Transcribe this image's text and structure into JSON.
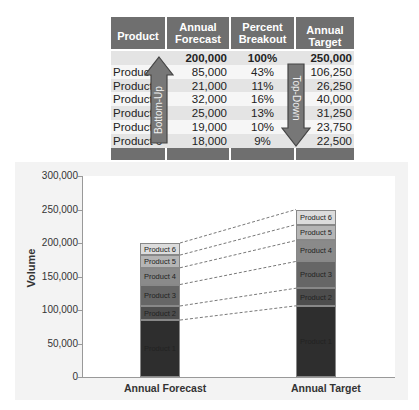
{
  "table": {
    "headers": [
      "Product",
      "Annual Forecast",
      "Percent Breakout",
      "Annual Target"
    ],
    "total_row": {
      "product": "",
      "forecast": "200,000",
      "percent": "100%",
      "target": "250,000"
    },
    "rows": [
      {
        "product": "Product 1",
        "forecast": "85,000",
        "percent": "43%",
        "target": "106,250"
      },
      {
        "product": "Product 2",
        "forecast": "21,000",
        "percent": "11%",
        "target": "26,250"
      },
      {
        "product": "Product 3",
        "forecast": "32,000",
        "percent": "16%",
        "target": "40,000"
      },
      {
        "product": "Product 4",
        "forecast": "25,000",
        "percent": "13%",
        "target": "31,250"
      },
      {
        "product": "Product 5",
        "forecast": "19,000",
        "percent": "10%",
        "target": "23,750"
      },
      {
        "product": "Product 6",
        "forecast": "18,000",
        "percent": "9%",
        "target": "22,500"
      }
    ],
    "arrow_up_label": "Bottom-Up",
    "arrow_down_label": "Top-Down"
  },
  "chart_data": {
    "type": "bar",
    "stacked": true,
    "title": "",
    "xlabel": "",
    "ylabel": "Volume",
    "ylim": [
      0,
      300000
    ],
    "yticks": [
      "0",
      "50,000",
      "100,000",
      "150,000",
      "200,000",
      "250,000",
      "300,000"
    ],
    "categories": [
      "Annual Forecast",
      "Annual Target"
    ],
    "series": [
      {
        "name": "Product 1",
        "values": [
          85000,
          106250
        ],
        "color": "#2e2e2e"
      },
      {
        "name": "Product 2",
        "values": [
          21000,
          26250
        ],
        "color": "#4d4d4d"
      },
      {
        "name": "Product 3",
        "values": [
          32000,
          40000
        ],
        "color": "#666666"
      },
      {
        "name": "Product 4",
        "values": [
          25000,
          31250
        ],
        "color": "#8a8a8a"
      },
      {
        "name": "Product 5",
        "values": [
          19000,
          23750
        ],
        "color": "#b5b5b5"
      },
      {
        "name": "Product 6",
        "values": [
          18000,
          22500
        ],
        "color": "#dcdcdc"
      }
    ],
    "connectors": "dashed lines between segment tops",
    "grid": false,
    "legend": "labels inside segments"
  }
}
